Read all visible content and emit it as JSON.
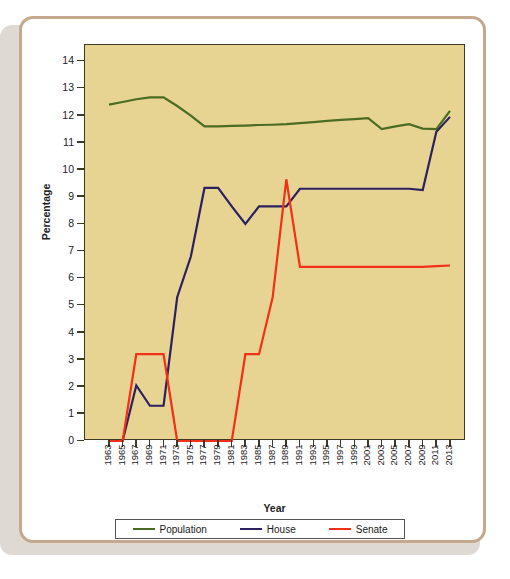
{
  "chart_data": {
    "type": "line",
    "title": "",
    "xlabel": "Year",
    "ylabel": "Percentage",
    "xlim": [
      1963,
      2013
    ],
    "ylim": [
      0,
      14.6
    ],
    "grid": false,
    "legend_position": "bottom",
    "x": [
      1963,
      1965,
      1967,
      1969,
      1971,
      1973,
      1975,
      1977,
      1979,
      1981,
      1983,
      1985,
      1987,
      1989,
      1991,
      1993,
      1995,
      1997,
      1999,
      2001,
      2003,
      2005,
      2007,
      2009,
      2011,
      2013
    ],
    "categories": [
      "1963",
      "1965",
      "1967",
      "1969",
      "1971",
      "1973",
      "1975",
      "1977",
      "1979",
      "1981",
      "1983",
      "1985",
      "1987",
      "1989",
      "1991",
      "1993",
      "1995",
      "1997",
      "1999",
      "2001",
      "2003",
      "2005",
      "2007",
      "2009",
      "2011",
      "2013"
    ],
    "yticks": [
      0,
      1,
      2,
      3,
      4,
      5,
      6,
      7,
      8,
      9,
      10,
      11,
      12,
      13,
      14
    ],
    "series": [
      {
        "name": "Population",
        "color": "#4a6b22",
        "values": [
          12.4,
          12.5,
          12.6,
          12.67,
          12.67,
          12.35,
          12.0,
          11.6,
          11.6,
          11.62,
          11.63,
          11.65,
          11.66,
          11.68,
          11.72,
          11.76,
          11.8,
          11.84,
          11.87,
          11.9,
          11.5,
          11.6,
          11.68,
          11.52,
          11.5,
          12.17
        ]
      },
      {
        "name": "House",
        "color": "#2b2060",
        "values": [
          0.0,
          0.0,
          2.05,
          1.3,
          1.3,
          5.3,
          6.8,
          9.33,
          9.33,
          8.65,
          8.0,
          8.65,
          8.65,
          8.65,
          9.3,
          9.3,
          9.3,
          9.3,
          9.3,
          9.3,
          9.3,
          9.3,
          9.3,
          9.25,
          11.4,
          11.95
        ]
      },
      {
        "name": "Senate",
        "color": "#f42f18",
        "values": [
          0.0,
          0.0,
          3.2,
          3.2,
          3.2,
          0.0,
          0.0,
          0.0,
          0.0,
          0.0,
          3.2,
          3.2,
          5.3,
          9.65,
          6.42,
          6.42,
          6.42,
          6.42,
          6.42,
          6.42,
          6.42,
          6.42,
          6.42,
          6.42,
          6.45,
          6.47
        ]
      }
    ]
  },
  "legend": {
    "items": [
      {
        "label": "Population",
        "color": "#4a6b22"
      },
      {
        "label": "House",
        "color": "#2b2060"
      },
      {
        "label": "Senate",
        "color": "#f42f18"
      }
    ]
  },
  "style": {
    "panel_background": "#e8d492",
    "panel_border": "#3f3a26",
    "card_border": "#c5a98e",
    "card_background": "#ffffff",
    "page_background": "#ffffff",
    "shadow_color": "#dedad3",
    "tick_text": "#222222",
    "axis_title_text": "#1d1d1d"
  }
}
